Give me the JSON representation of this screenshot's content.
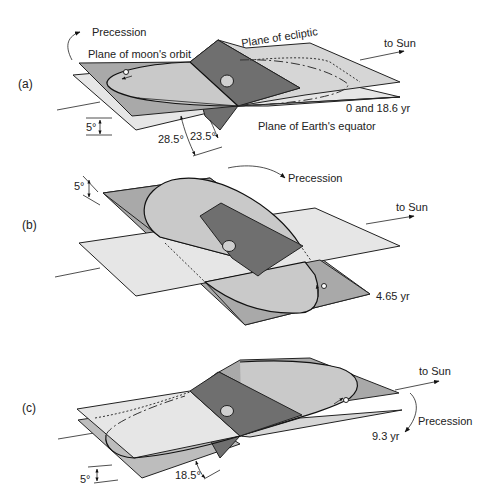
{
  "figure": {
    "colors": {
      "background": "#ffffff",
      "equator_plane": "#e6e6e6",
      "ecliptic_plane": "#bdbdbd",
      "moon_orbit_plane": "#a9a9a9",
      "terminator_plane": "#6f6f6f",
      "line": "#222222"
    }
  },
  "panels": [
    {
      "id": "a",
      "label": "(a)",
      "precession_label": "Precession",
      "time_label": "0 and 18.6 yr",
      "to_sun_label": "to Sun",
      "plane_labels": {
        "moon_orbit": "Plane of moon's orbit",
        "ecliptic": "Plane of ecliptic",
        "equator": "Plane of Earth's equator"
      },
      "angles": {
        "inclination": "5°",
        "max_declination": "28.5°",
        "obliquity": "23.5°"
      }
    },
    {
      "id": "b",
      "label": "(b)",
      "precession_label": "Precession",
      "time_label": "4.65 yr",
      "to_sun_label": "to Sun",
      "angles": {
        "inclination": "5°"
      }
    },
    {
      "id": "c",
      "label": "(c)",
      "precession_label": "Precession",
      "time_label": "9.3 yr",
      "to_sun_label": "to Sun",
      "angles": {
        "inclination": "5°",
        "min_declination": "18.5°"
      }
    }
  ]
}
